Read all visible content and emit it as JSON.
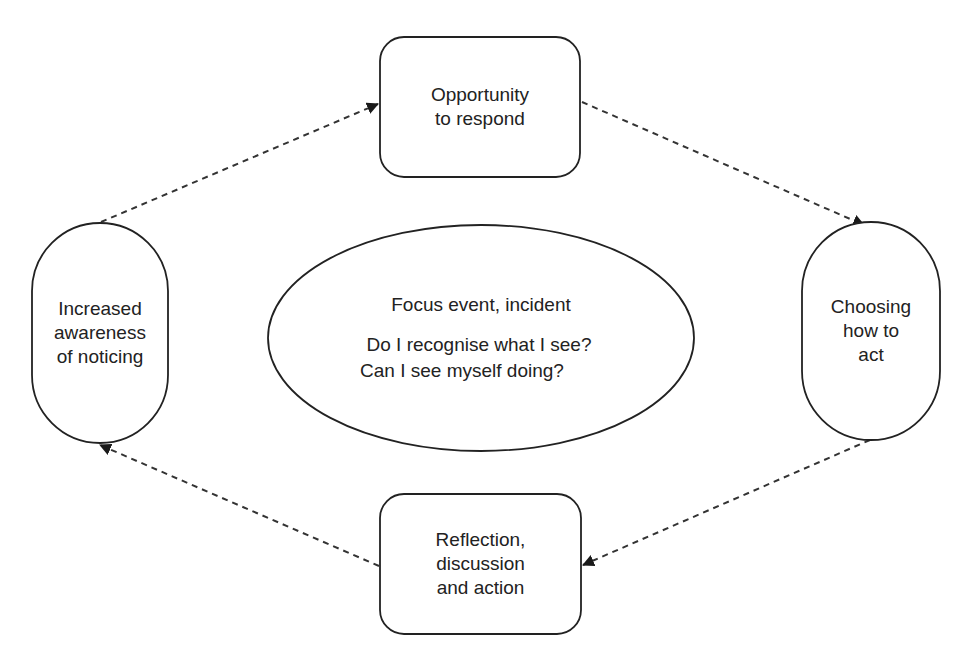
{
  "diagram": {
    "nodes": {
      "top": {
        "shape": "rounded-rectangle",
        "lines": [
          "Opportunity",
          "to respond"
        ]
      },
      "right": {
        "shape": "stadium",
        "lines": [
          "Choosing",
          "how to",
          "act"
        ]
      },
      "bottom": {
        "shape": "rounded-rectangle",
        "lines": [
          "Reflection,",
          "discussion",
          "and action"
        ]
      },
      "left": {
        "shape": "stadium",
        "lines": [
          "Increased",
          "awareness",
          "of noticing"
        ]
      },
      "center": {
        "shape": "ellipse",
        "title": "Focus event, incident",
        "questions": [
          "Do I recognise what I see?",
          "Can I see myself doing?"
        ]
      }
    },
    "edges": [
      {
        "from": "left",
        "to": "top",
        "style": "dashed"
      },
      {
        "from": "top",
        "to": "right",
        "style": "dashed"
      },
      {
        "from": "right",
        "to": "bottom",
        "style": "dashed"
      },
      {
        "from": "bottom",
        "to": "left",
        "style": "dashed"
      }
    ],
    "colors": {
      "stroke": "#222222",
      "background": "#ffffff",
      "text": "#222222"
    }
  }
}
